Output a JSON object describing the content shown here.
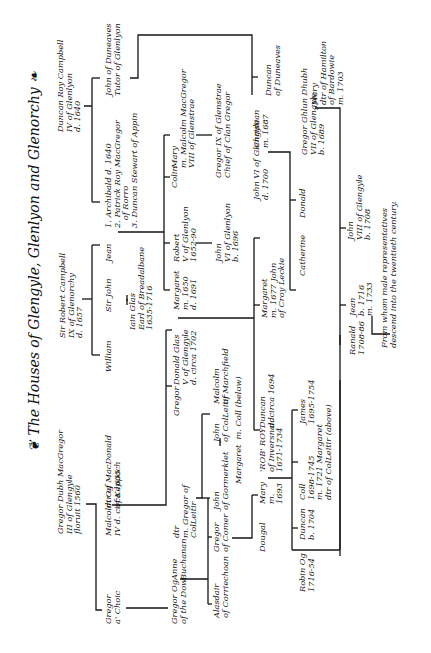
{
  "title": "The Houses of Glengyle, Glenlyon and Glenorchy",
  "title_ornament_left": "❦",
  "title_ornament_right": "❧",
  "note": "Transcription of handwritten script is best-effort; many names and dates are uncertain.",
  "people": {
    "duncan_roy": "Duncan Roy Campbell\nIV of Glenlyon\nd. 1640",
    "john_duneaves": "John of Duneaves\nTutor of Glenlyon",
    "archibald": "1. Archibald d. 1640\n2. Patrick Roy MacGregor\n   of Rorro\n3. Duncan Stewart of Appin",
    "jean": "Jean",
    "sir_robert": "Sir Robert Campbell\nIX of Glenorchy\nd. 1657",
    "william": "William",
    "sir_john": "Sir John",
    "iain_glas": "Iain Glas\nEarl of Breadalbane\n1635-1716",
    "mary_malcolm": "Mary\nm. Malcolm MacGregor\nVIII of Glenstrae",
    "gregor_ix": "Gregor IX of Glenstrae\nChief of Clan Gregor",
    "colin": "Colin",
    "robert_v": "Robert\nV of Glenlyon\n1652-90",
    "john_vi_glenlyon": "John\nVI of Glenlyon\nb. 1696",
    "margaret_1650": "Margaret\nm. 1650\nd. 1691",
    "donald_glas": "Donald Glas\nV of Glengyle\nd. circa 1702",
    "duncan_duneaves": "Duncan\nof Duneaves",
    "john_vi_glengyle": "John VI of Glengyle\nd. 1700",
    "christian": "Christian\nm. 1687",
    "margaret_croy": "Margaret\nm. 1677 John\nof Croy Leckie",
    "catherine": "Catherine",
    "donald": "Donald",
    "gregor_ghlun": "Gregor Ghlun Dhubh\nVII of Glengyle\nb. 1689",
    "mary_hamilton": "Mary\ndtr of Hamilton\nof Bardowie\nm. 1703",
    "john_viii": "John\nVIII of Glengyle\nb. 1708",
    "jean_1716": "Jean\nb. 1716\nm. 1733",
    "ranald": "Ranald\n1708-86",
    "descend_note": "From whom male representatives\ndescend into the twentieth century.",
    "gregor_dubh": "Gregor Dubh MacGregor\nIII of Glengyle\nfloruit 1560",
    "malcolm_og": "Malcolm Og\nIV d. circa 1635",
    "dtr_keppoch": "dtr of MacDonald\nof Keppoch",
    "gregor_a_choic": "Gregor\na' Choic",
    "gregor_og": "Gregor Og\nof the Dow",
    "anne_buchanan": "Anne\nBuchanan",
    "dtr_gregor": "dtr\nm. Gregor of\nColLeitir",
    "gregor": "Gregor",
    "malcolm_marchfield": "Malcolm\nof Marchfield",
    "john_colleitir": "John\nof ColLeitir",
    "margaret_coll": "Margaret  m. Coll (below)",
    "john_gormerklet": "John\nof Gormerklet",
    "gregor_comer": "Gregor\nof Comer",
    "alasdair": "Alasdair\nof Corriechoan",
    "duncan_1694": "Duncan\nd. circa 1694",
    "rob_roy": "'ROB' ROY\nof Inversnaid\n1671-1734",
    "mary_1693": "Mary\nm.\n1693",
    "dougal": "Dougal",
    "james": "James\n1695-1754",
    "coll": "Coll\n1698-1745\nm. 1721 Margaret\ndtr of ColLeitir (above)",
    "duncan_1704": "Duncan\nb. 1704",
    "robin_og": "Robin Og\n1716-54"
  },
  "marriage_mark": "="
}
